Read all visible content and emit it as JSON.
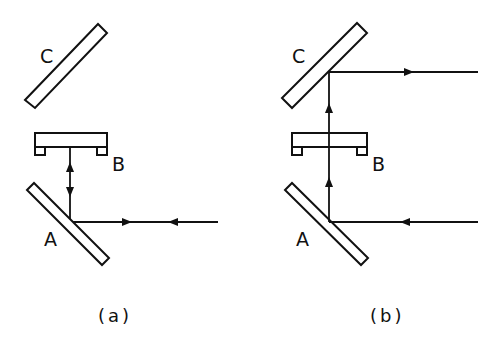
{
  "figure": {
    "panels": [
      {
        "id": "a",
        "caption": "(a)",
        "labels": {
          "C": "C",
          "B": "B",
          "A": "A"
        },
        "description": "Beam enters from right, reflects at mirror A upward to component B and returns; mirror C unused"
      },
      {
        "id": "b",
        "caption": "(b)",
        "labels": {
          "C": "C",
          "B": "B",
          "A": "A"
        },
        "description": "Beam enters from right, reflects at mirror A upward through component B, reflects at mirror C and exits to the right"
      }
    ],
    "colors": {
      "ink": "#111111",
      "background": "#ffffff"
    }
  }
}
